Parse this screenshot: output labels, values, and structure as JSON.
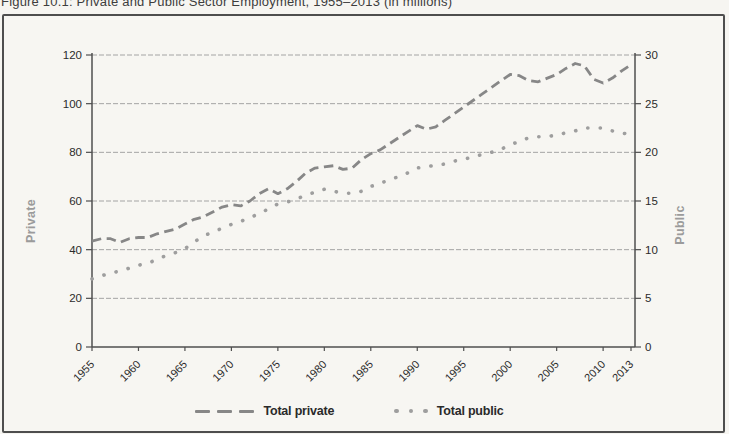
{
  "chart_data": {
    "type": "line",
    "title": "Figure 10.1: Private and Public Sector Employment, 1955–2013 (in millions)",
    "x": [
      1955,
      1956,
      1957,
      1958,
      1959,
      1960,
      1961,
      1962,
      1963,
      1964,
      1965,
      1966,
      1967,
      1968,
      1969,
      1970,
      1971,
      1972,
      1973,
      1974,
      1975,
      1976,
      1977,
      1978,
      1979,
      1980,
      1981,
      1982,
      1983,
      1984,
      1985,
      1986,
      1987,
      1988,
      1989,
      1990,
      1991,
      1992,
      1993,
      1994,
      1995,
      1996,
      1997,
      1998,
      1999,
      2000,
      2001,
      2002,
      2003,
      2004,
      2005,
      2006,
      2007,
      2008,
      2009,
      2010,
      2011,
      2012,
      2013
    ],
    "series": [
      {
        "name": "Total private",
        "axis": "left",
        "style": "dashed",
        "color": "#878787",
        "values": [
          43.5,
          44.5,
          44.5,
          43.0,
          44.5,
          45.0,
          45.0,
          46.5,
          47.5,
          48.5,
          50.5,
          52.5,
          53.5,
          55.5,
          57.5,
          58.5,
          58.0,
          60.0,
          63.0,
          65.0,
          63.0,
          65.0,
          68.0,
          71.5,
          73.5,
          74.0,
          74.5,
          73.0,
          73.5,
          77.0,
          79.5,
          81.0,
          83.5,
          86.0,
          88.5,
          91.0,
          89.5,
          90.5,
          93.2,
          95.9,
          98.6,
          101.3,
          104.0,
          106.7,
          109.4,
          112.0,
          111.5,
          109.5,
          109.0,
          110.5,
          112.0,
          114.5,
          116.5,
          115.5,
          110.0,
          108.5,
          110.5,
          113.5,
          116.0
        ]
      },
      {
        "name": "Total public",
        "axis": "right",
        "style": "dotted",
        "color": "#9e9e9e",
        "values": [
          7.0,
          7.3,
          7.6,
          7.8,
          8.1,
          8.4,
          8.6,
          9.0,
          9.4,
          9.7,
          10.1,
          10.8,
          11.4,
          11.8,
          12.2,
          12.6,
          12.9,
          13.3,
          13.7,
          14.2,
          14.7,
          14.9,
          15.2,
          15.6,
          15.9,
          16.2,
          16.0,
          15.8,
          15.8,
          16.0,
          16.5,
          16.8,
          17.2,
          17.5,
          17.9,
          18.4,
          18.5,
          18.7,
          18.8,
          19.1,
          19.3,
          19.5,
          19.8,
          20.0,
          20.3,
          20.8,
          21.1,
          21.5,
          21.6,
          21.6,
          21.8,
          22.0,
          22.2,
          22.5,
          22.5,
          22.5,
          22.2,
          22.0,
          21.8
        ]
      }
    ],
    "left_axis": {
      "label": "Private",
      "range": [
        0,
        120
      ],
      "ticks": [
        0,
        20,
        40,
        60,
        80,
        100,
        120
      ]
    },
    "right_axis": {
      "label": "Public",
      "range": [
        0,
        30
      ],
      "ticks": [
        0,
        5,
        10,
        15,
        20,
        25,
        30
      ]
    },
    "x_axis": {
      "tick_labels": [
        "1955",
        "1960",
        "1965",
        "1970",
        "1975",
        "1980",
        "1985",
        "1990",
        "1995",
        "2000",
        "2005",
        "2010",
        "2013"
      ]
    },
    "legend": {
      "position": "bottom"
    },
    "grid": "horizontal-dashed",
    "colors": {
      "axis": "#4f4f4f",
      "gridline": "#a4a4a4",
      "tick_text": "#2b2b2b",
      "axis_title": "#9b9b9b",
      "frame_border": "#4e4e4e",
      "background": "#f6f5f1"
    }
  }
}
